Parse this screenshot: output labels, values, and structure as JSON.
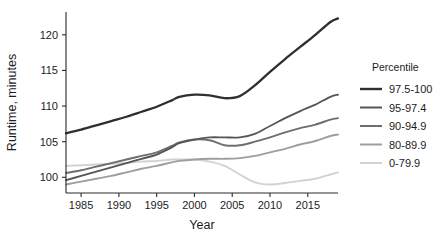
{
  "chart_data": {
    "type": "line",
    "title": "",
    "xlabel": "Year",
    "ylabel": "Runtime, minutes",
    "xlim": [
      1983,
      2019
    ],
    "ylim": [
      97.8,
      123.2
    ],
    "xticks": [
      1985,
      1990,
      1995,
      2000,
      2005,
      2010,
      2015
    ],
    "yticks": [
      100,
      105,
      110,
      115,
      120
    ],
    "grid": false,
    "legend_position": "right",
    "legend_title": "Percentile",
    "x": [
      1983,
      1985,
      1987,
      1989,
      1991,
      1993,
      1995,
      1997,
      1998,
      2000,
      2002,
      2004,
      2006,
      2008,
      2010,
      2012,
      2014,
      2016,
      2018,
      2019
    ],
    "series": [
      {
        "name": "97.5-100",
        "color": "#2f2f2f",
        "values": [
          106.2,
          106.7,
          107.3,
          107.9,
          108.5,
          109.2,
          109.9,
          110.8,
          111.3,
          111.6,
          111.5,
          111.1,
          111.4,
          112.9,
          114.8,
          116.6,
          118.3,
          120.0,
          121.8,
          122.3
        ]
      },
      {
        "name": "95-97.4",
        "color": "#565656",
        "values": [
          99.6,
          100.2,
          100.8,
          101.4,
          102.0,
          102.6,
          103.2,
          104.2,
          104.8,
          105.3,
          105.6,
          105.6,
          105.6,
          106.1,
          107.2,
          108.3,
          109.3,
          110.2,
          111.3,
          111.6
        ]
      },
      {
        "name": "90-94.9",
        "color": "#6e6e6e",
        "values": [
          100.6,
          101.0,
          101.5,
          102.0,
          102.5,
          103.0,
          103.5,
          104.4,
          104.9,
          105.3,
          105.2,
          104.5,
          104.5,
          105.0,
          105.6,
          106.3,
          106.9,
          107.4,
          108.1,
          108.3
        ]
      },
      {
        "name": "80-89.9",
        "color": "#9e9e9e",
        "values": [
          99.0,
          99.4,
          99.8,
          100.2,
          100.7,
          101.2,
          101.6,
          102.1,
          102.3,
          102.5,
          102.6,
          102.6,
          102.7,
          103.0,
          103.5,
          104.0,
          104.6,
          105.1,
          105.8,
          106.0
        ]
      },
      {
        "name": "0-79.9",
        "color": "#d2d2d2",
        "values": [
          101.6,
          101.7,
          101.8,
          101.9,
          102.0,
          102.2,
          102.3,
          102.5,
          102.5,
          102.5,
          102.2,
          101.6,
          100.4,
          99.3,
          99.0,
          99.2,
          99.5,
          99.8,
          100.4,
          100.7
        ]
      }
    ]
  },
  "axes": {
    "ylabel": "Runtime, minutes",
    "xlabel": "Year",
    "ytick_labels": [
      "100",
      "105",
      "110",
      "115",
      "120"
    ],
    "xtick_labels": [
      "1985",
      "1990",
      "1995",
      "2000",
      "2005",
      "2010",
      "2015"
    ]
  },
  "legend": {
    "title": "Percentile",
    "items": [
      {
        "label": "97.5-100",
        "color": "#2f2f2f"
      },
      {
        "label": "95-97.4",
        "color": "#565656"
      },
      {
        "label": "90-94.9",
        "color": "#6e6e6e"
      },
      {
        "label": "80-89.9",
        "color": "#9e9e9e"
      },
      {
        "label": "0-79.9",
        "color": "#d2d2d2"
      }
    ]
  }
}
